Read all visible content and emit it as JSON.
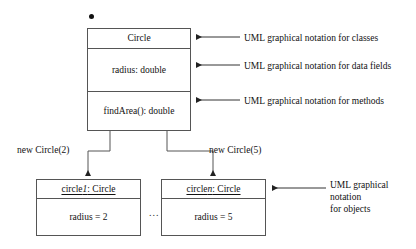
{
  "diagram": {
    "type": "uml-class-and-object-diagram",
    "background_color": "#ffffff",
    "line_color": "#555555",
    "text_color": "#111111",
    "top_marker": "●"
  },
  "class_box": {
    "name": "Circle",
    "fields": "radius: double",
    "methods": "findArea(): double"
  },
  "annotations": {
    "classes": "UML graphical notation for classes",
    "data_fields": "UML graphical notation for data fields",
    "methods": "UML graphical notation for methods",
    "objects_line1": "UML graphical notation",
    "objects_line2": "for objects"
  },
  "instantiation_labels": {
    "left": "new Circle(2)",
    "right": "new Circle(5)"
  },
  "objects": [
    {
      "name_prefix": "circle",
      "name_index": "1",
      "name_suffix": ": Circle",
      "field": "radius = 2"
    },
    {
      "name_prefix": "circle",
      "name_index": "n",
      "name_suffix": ": Circle",
      "field": "radius = 5"
    }
  ],
  "separator": {
    "ellipsis": "..."
  }
}
